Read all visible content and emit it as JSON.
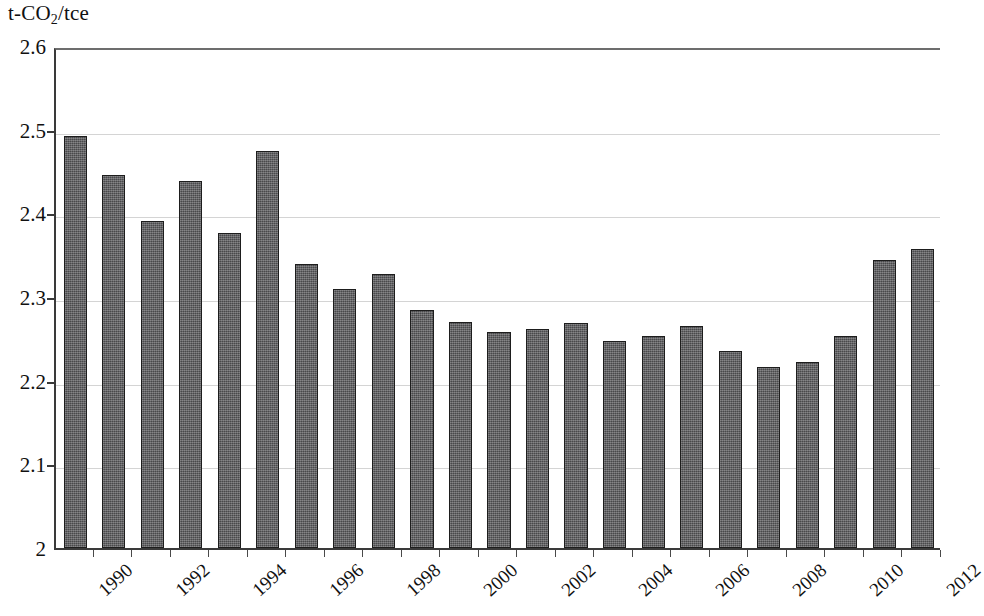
{
  "chart_data": {
    "type": "bar",
    "title": "",
    "subtitle": "",
    "ylabel": "t-CO2/tce",
    "ylabel_html": "t-CO<sub>2</sub>/tce",
    "xlabel": "",
    "ylim": [
      2,
      2.6
    ],
    "ytick_labels": [
      "2.6",
      "2.5",
      "2.4",
      "2.3",
      "2.2",
      "2.1",
      "2"
    ],
    "ytick_values": [
      2.6,
      2.5,
      2.4,
      2.3,
      2.2,
      2.1,
      2.0
    ],
    "grid": "horizontal",
    "legend": "none",
    "bar_color": "#59595b",
    "bar_edge_color": "#1d1d1d",
    "grid_color": "#d4d4d4",
    "axis_color": "#3a3a3a",
    "categories": [
      "1990",
      "1991",
      "1992",
      "1993",
      "1994",
      "1995",
      "1996",
      "1997",
      "1998",
      "1999",
      "2000",
      "2001",
      "2002",
      "2003",
      "2004",
      "2005",
      "2006",
      "2007",
      "2008",
      "2009",
      "2010",
      "2011",
      "2012"
    ],
    "xtick_labels_shown": [
      "1990",
      "1992",
      "1994",
      "1996",
      "1998",
      "2000",
      "2002",
      "2004",
      "2006",
      "2008",
      "2010",
      "2012"
    ],
    "values": [
      2.492,
      2.446,
      2.391,
      2.439,
      2.376,
      2.475,
      2.34,
      2.31,
      2.327,
      2.284,
      2.27,
      2.258,
      2.262,
      2.269,
      2.247,
      2.254,
      2.265,
      2.236,
      2.216,
      2.222,
      2.253,
      2.344,
      2.357
    ]
  }
}
